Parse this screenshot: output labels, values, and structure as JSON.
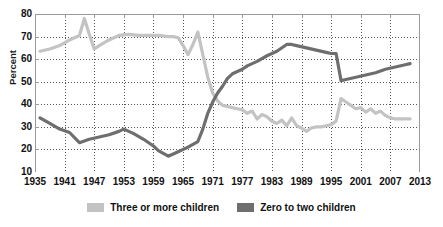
{
  "chart_data": {
    "type": "line",
    "title": "",
    "xlabel": "",
    "ylabel": "Percent",
    "xlim": [
      1935,
      2013
    ],
    "ylim": [
      10,
      80
    ],
    "ytick_labels": [
      "80",
      "70",
      "60",
      "50",
      "40",
      "30",
      "20",
      "10"
    ],
    "ytick_values": [
      80,
      70,
      60,
      50,
      40,
      30,
      20,
      10
    ],
    "xtick_labels": [
      "1935",
      "1941",
      "1947",
      "1953",
      "1959",
      "1965",
      "1971",
      "1977",
      "1983",
      "1989",
      "1995",
      "2001",
      "2007",
      "2013"
    ],
    "xtick_values": [
      1935,
      1941,
      1947,
      1953,
      1959,
      1965,
      1971,
      1977,
      1983,
      1989,
      1995,
      2001,
      2007,
      2013
    ],
    "grid": true,
    "grid_style": "dotted",
    "legend_position": "bottom",
    "colors": {
      "three_or_more": "#c3c3c3",
      "zero_to_two": "#6e6e6e",
      "axis": "#9a9a9a",
      "grid": "#555555",
      "text": "#111111"
    },
    "series": [
      {
        "name": "Three or more children",
        "color": "#c3c3c3",
        "x": [
          1936,
          1938,
          1940,
          1942,
          1944,
          1945,
          1946,
          1947,
          1948,
          1950,
          1952,
          1954,
          1956,
          1958,
          1960,
          1962,
          1963,
          1964,
          1965,
          1966,
          1967,
          1968,
          1969,
          1970,
          1971,
          1972,
          1973,
          1974,
          1975,
          1976,
          1977,
          1978,
          1979,
          1980,
          1981,
          1982,
          1983,
          1984,
          1985,
          1986,
          1987,
          1988,
          1989,
          1990,
          1991,
          1992,
          1993,
          1994,
          1995,
          1996,
          1997,
          1998,
          1999,
          2000,
          2001,
          2002,
          2003,
          2004,
          2005,
          2006,
          2007,
          2008,
          2009,
          2010,
          2011
        ],
        "values": [
          63.5,
          64.5,
          66.0,
          68.5,
          70.5,
          78.0,
          71.0,
          64.5,
          66.0,
          68.5,
          70.5,
          71.0,
          70.5,
          70.5,
          70.5,
          70.0,
          70.0,
          69.5,
          66.0,
          62.0,
          66.5,
          72.0,
          62.0,
          52.0,
          45.0,
          41.5,
          39.5,
          39.0,
          38.5,
          38.0,
          37.5,
          36.0,
          37.0,
          33.5,
          35.5,
          34.5,
          32.5,
          31.5,
          33.0,
          30.5,
          34.0,
          30.5,
          29.5,
          28.0,
          29.5,
          30.0,
          30.0,
          30.5,
          31.0,
          32.5,
          42.5,
          41.0,
          39.5,
          38.0,
          38.5,
          36.5,
          38.0,
          36.0,
          37.0,
          35.0,
          34.0,
          33.5,
          33.5,
          33.5,
          33.5
        ]
      },
      {
        "name": "Zero to two children",
        "color": "#6e6e6e",
        "x": [
          1936,
          1938,
          1940,
          1942,
          1944,
          1946,
          1948,
          1950,
          1952,
          1953,
          1955,
          1957,
          1959,
          1960,
          1962,
          1964,
          1966,
          1968,
          1969,
          1970,
          1971,
          1972,
          1973,
          1974,
          1975,
          1976,
          1977,
          1978,
          1980,
          1982,
          1984,
          1986,
          1987,
          1988,
          1990,
          1992,
          1994,
          1995,
          1996,
          1997,
          1998,
          2000,
          2002,
          2004,
          2006,
          2008,
          2010,
          2011
        ],
        "values": [
          34.0,
          31.5,
          29.0,
          27.5,
          23.0,
          24.5,
          25.5,
          26.5,
          28.0,
          29.0,
          27.0,
          24.5,
          21.5,
          19.5,
          17.0,
          19.0,
          21.0,
          23.5,
          29.0,
          36.0,
          41.0,
          45.0,
          48.0,
          51.5,
          53.5,
          54.5,
          55.5,
          57.0,
          59.0,
          61.5,
          63.5,
          66.5,
          66.5,
          66.0,
          65.0,
          64.0,
          63.0,
          62.5,
          62.5,
          50.5,
          51.0,
          52.0,
          53.0,
          54.0,
          55.5,
          56.5,
          57.5,
          58.0
        ]
      }
    ]
  },
  "legend": {
    "items": [
      {
        "label": "Three or more children",
        "color": "#c3c3c3"
      },
      {
        "label": "Zero to two children",
        "color": "#6e6e6e"
      }
    ]
  }
}
